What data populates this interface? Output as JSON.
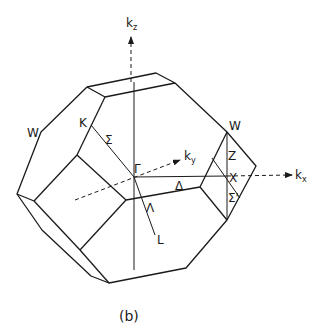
{
  "figure": {
    "caption": "(b)"
  },
  "axes": {
    "kz": {
      "main": "k",
      "sub": "z"
    },
    "ky": {
      "main": "k",
      "sub": "y"
    },
    "kx": {
      "main": "k",
      "sub": "x"
    }
  },
  "points": {
    "gamma": "Γ",
    "x": "X",
    "l": "L",
    "k": "K",
    "w_left": "W",
    "w_right": "W"
  },
  "lines": {
    "sigma": "Σ",
    "delta": "Δ",
    "lambda": "Λ",
    "z": "Z",
    "sigma_prime": "Σ'"
  }
}
